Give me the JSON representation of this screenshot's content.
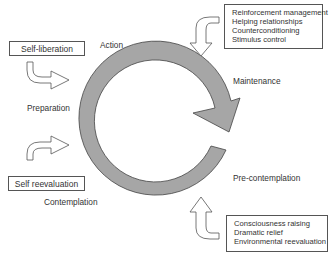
{
  "diagram": {
    "type": "cycle",
    "ring_color": "#a6a6a6",
    "stroke_color": "#444444",
    "stages": [
      {
        "id": "action",
        "label": "Action"
      },
      {
        "id": "maintenance",
        "label": "Maintenance"
      },
      {
        "id": "precontemplation",
        "label": "Pre-contemplation"
      },
      {
        "id": "contemplation",
        "label": "Contemplation"
      },
      {
        "id": "preparation",
        "label": "Preparation"
      }
    ],
    "process_boxes": {
      "self_liberation": {
        "label": "Self-liberation"
      },
      "self_reevaluation": {
        "label": "Self reevaluation"
      },
      "action_maintenance": {
        "items": [
          "Reinforcement management",
          "Helping relationships",
          "Counterconditioning",
          "Stimulus control"
        ]
      },
      "precontemplation_contemplation": {
        "items": [
          "Consciousness raising",
          "Dramatic relief",
          "Environmental reevaluation"
        ]
      }
    }
  }
}
